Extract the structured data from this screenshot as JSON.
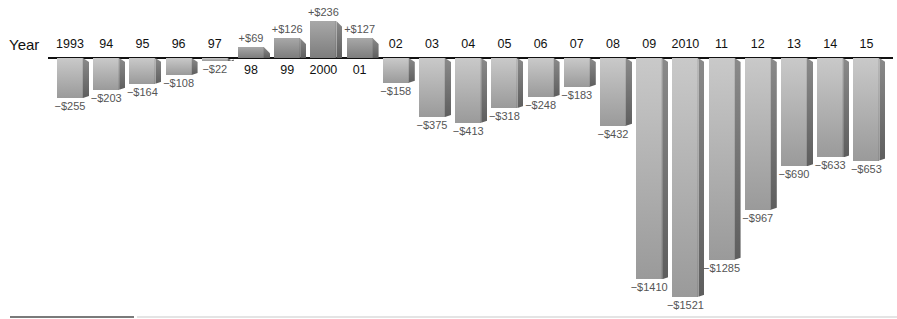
{
  "chart_data": {
    "type": "bar",
    "title": "",
    "xlabel": "Year",
    "ylabel": "",
    "categories": [
      "1993",
      "94",
      "95",
      "96",
      "97",
      "98",
      "99",
      "2000",
      "01",
      "02",
      "03",
      "04",
      "05",
      "06",
      "07",
      "08",
      "09",
      "2010",
      "11",
      "12",
      "13",
      "14",
      "15"
    ],
    "values": [
      -255,
      -203,
      -164,
      -108,
      -22,
      69,
      126,
      236,
      127,
      -158,
      -375,
      -413,
      -318,
      -248,
      -183,
      -432,
      -1410,
      -1521,
      -1285,
      -967,
      -690,
      -633,
      -653
    ],
    "value_labels": [
      "-$255",
      "-$203",
      "-$164",
      "-$108",
      "-$22",
      "+$69",
      "+$126",
      "+$236",
      "+$127",
      "-$158",
      "-$375",
      "-$413",
      "-$318",
      "-$248",
      "-$183",
      "-$432",
      "-$1410",
      "-$1521",
      "-$1285",
      "-$967",
      "-$690",
      "-$633",
      "-$653"
    ],
    "ylim": [
      -1521,
      236
    ],
    "grid": false,
    "legend": null,
    "bar_style": "3d gray gradient",
    "units": "$"
  },
  "axis": {
    "title": "Year"
  },
  "colors": {
    "bar_light": "#c9c9c9",
    "bar_dark": "#9a9a9a",
    "bar_side": "#6e6e6e",
    "label_text": "#555555",
    "axis": "#111111"
  }
}
